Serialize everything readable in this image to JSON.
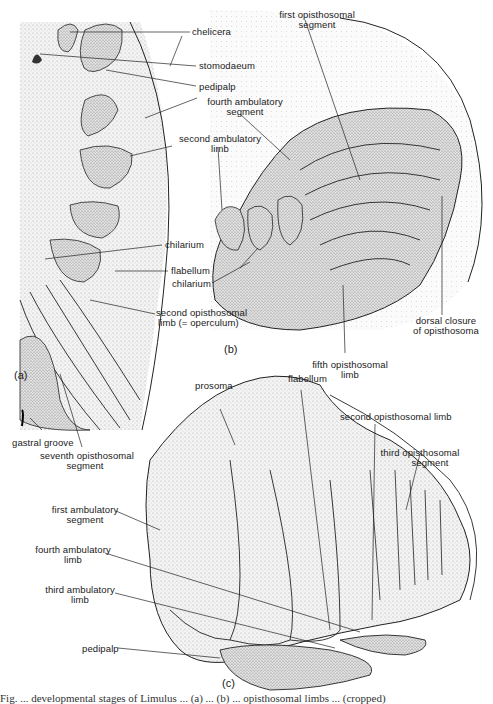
{
  "figure": {
    "panels": [
      {
        "id": "a",
        "label": "(a)"
      },
      {
        "id": "b",
        "label": "(b)"
      },
      {
        "id": "c",
        "label": "(c)"
      }
    ],
    "labels_a": {
      "chelicera": "chelicera",
      "stomodaeum": "stomodaeum",
      "pedipalp": "pedipalp",
      "chilarium": "chilarium",
      "flabellum": "flabellum",
      "second_opisthosomal_limb_1": "second opisthosomal",
      "second_opisthosomal_limb_2": "limb (= operculum)",
      "gastral_groove": "gastral groove",
      "seventh_opisthosomal_1": "seventh opisthosomal",
      "seventh_opisthosomal_2": "segment"
    },
    "labels_b": {
      "first_opisthosomal_1": "first opisthosomal",
      "first_opisthosomal_2": "segment",
      "fourth_ambulatory_segment_1": "fourth ambulatory",
      "fourth_ambulatory_segment_2": "segment",
      "second_ambulatory_limb_1": "second ambulatory",
      "second_ambulatory_limb_2": "limb",
      "chilarium": "chilarium",
      "dorsal_closure_1": "dorsal closure",
      "dorsal_closure_2": "of opisthosoma",
      "fifth_opisthosomal_1": "fifth opisthosomal",
      "fifth_opisthosomal_2": "limb"
    },
    "labels_c": {
      "prosoma": "prosoma",
      "flabellum": "flabellum",
      "second_opisthosomal_limb": "second opisthosomal limb",
      "third_opisthosomal_1": "third opisthosomal",
      "third_opisthosomal_2": "segment",
      "first_ambulatory_1": "first ambulatory",
      "first_ambulatory_2": "segment",
      "fourth_ambulatory_limb_1": "fourth ambulatory",
      "fourth_ambulatory_limb_2": "limb",
      "third_ambulatory_limb_1": "third ambulatory",
      "third_ambulatory_limb_2": "limb",
      "pedipalp": "pedipalp"
    },
    "caption_partial": "Fig. ... developmental stages of Limulus ... (a) ... (b) ... opisthosomal limbs ... (cropped)"
  }
}
